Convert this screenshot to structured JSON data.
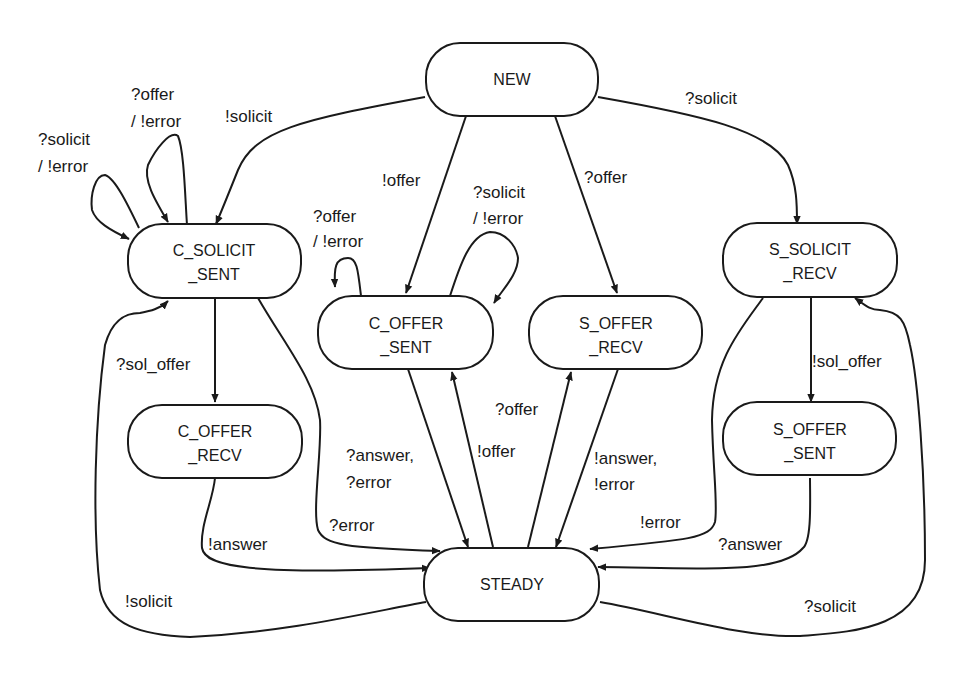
{
  "diagram": {
    "type": "state-machine",
    "states": {
      "new": {
        "line1": "NEW",
        "line2": ""
      },
      "c_solicit_sent": {
        "line1": "C_SOLICIT",
        "line2": "_SENT"
      },
      "c_offer_sent": {
        "line1": "C_OFFER",
        "line2": "_SENT"
      },
      "s_offer_recv": {
        "line1": "S_OFFER",
        "line2": "_RECV"
      },
      "s_solicit_recv": {
        "line1": "S_SOLICIT",
        "line2": "_RECV"
      },
      "c_offer_recv": {
        "line1": "C_OFFER",
        "line2": "_RECV"
      },
      "s_offer_sent": {
        "line1": "S_OFFER",
        "line2": "_SENT"
      },
      "steady": {
        "line1": "STEADY",
        "line2": ""
      }
    },
    "transitions": {
      "new_to_c_solicit_sent": {
        "line1": "!solicit"
      },
      "new_to_s_solicit_recv": {
        "line1": "?solicit"
      },
      "new_to_c_offer_sent": {
        "line1": "!offer"
      },
      "new_to_s_offer_recv": {
        "line1": "?offer"
      },
      "c_solicit_self_solicit": {
        "line1": "?solicit",
        "line2": "/ !error"
      },
      "c_solicit_self_offer": {
        "line1": "?offer",
        "line2": "/ !error"
      },
      "c_offer_sent_self_offer": {
        "line1": "?offer",
        "line2": "/ !error"
      },
      "c_offer_sent_self_solicit": {
        "line1": "?solicit",
        "line2": "/ !error"
      },
      "c_solicit_to_c_offer_recv": {
        "line1": "?sol_offer"
      },
      "c_solicit_to_steady": {
        "line1": "?error"
      },
      "c_offer_recv_to_steady": {
        "line1": "!answer"
      },
      "steady_to_c_solicit": {
        "line1": "!solicit"
      },
      "c_offer_sent_to_steady": {
        "line1": "?answer,",
        "line2": "?error"
      },
      "steady_to_c_offer_sent": {
        "line1": "!offer"
      },
      "steady_to_s_offer_recv": {
        "line1": "?offer"
      },
      "s_offer_recv_to_steady": {
        "line1": "!answer,",
        "line2": "!error"
      },
      "s_solicit_recv_to_s_offer_sent": {
        "line1": "!sol_offer"
      },
      "s_solicit_recv_to_steady": {
        "line1": "!error"
      },
      "s_offer_sent_to_steady": {
        "line1": "?answer"
      },
      "steady_to_s_solicit_recv": {
        "line1": "?solicit"
      }
    }
  }
}
